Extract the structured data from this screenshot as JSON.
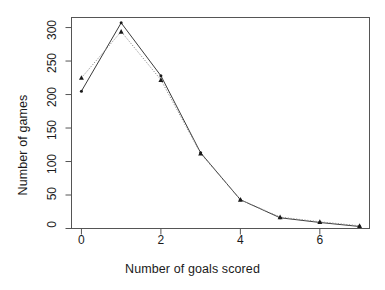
{
  "chart_data": {
    "type": "line",
    "title": "",
    "xlabel": "Number of goals scored",
    "ylabel": "Number of games",
    "x": [
      0,
      1,
      2,
      3,
      4,
      5,
      6,
      7
    ],
    "xlim": [
      -0.25,
      7.25
    ],
    "ylim": [
      0,
      315
    ],
    "xticks": [
      0,
      2,
      4,
      6
    ],
    "xtick_labels": [
      "0",
      "2",
      "4",
      "6"
    ],
    "yticks": [
      0,
      50,
      100,
      150,
      200,
      250,
      300
    ],
    "ytick_labels": [
      "0",
      "50",
      "100",
      "150",
      "200",
      "250",
      "300"
    ],
    "grid": false,
    "legend": false,
    "box": true,
    "series": [
      {
        "name": "observed",
        "style": "solid",
        "color": "#3a3a3a",
        "marker": "point",
        "values": [
          205,
          307,
          228,
          113,
          43,
          16,
          9,
          3
        ]
      },
      {
        "name": "fitted",
        "style": "dotted",
        "color": "#8c8c8c",
        "marker": "triangle",
        "values": [
          225,
          294,
          222,
          112,
          43,
          17,
          10,
          4
        ]
      }
    ]
  }
}
